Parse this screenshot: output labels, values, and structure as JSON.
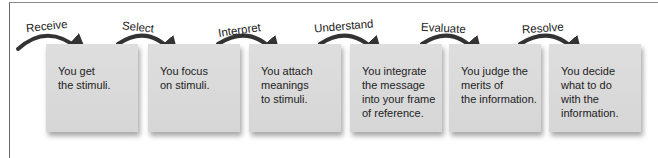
{
  "diagram": {
    "type": "process-flow",
    "steps": [
      {
        "label": "Receive",
        "text": "You get\nthe stimuli."
      },
      {
        "label": "Select",
        "text": "You focus\non stimuli."
      },
      {
        "label": "Interpret",
        "text": "You attach\nmeanings\nto stimuli."
      },
      {
        "label": "Understand",
        "text": "You integrate\nthe message\ninto your frame\nof reference."
      },
      {
        "label": "Evaluate",
        "text": "You judge the\nmerits of\nthe information."
      },
      {
        "label": "Resolve",
        "text": "You decide\nwhat to do\nwith the\ninformation."
      }
    ],
    "colors": {
      "box": "#d9d9d9",
      "arrow": "#333333",
      "text": "#222222"
    }
  }
}
